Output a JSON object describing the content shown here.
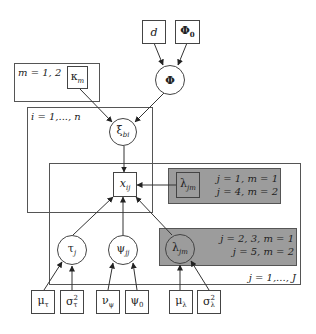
{
  "diagram": {
    "type": "plate-notation-graphical-model",
    "plates": {
      "m": {
        "label": "m = 1, 2"
      },
      "i": {
        "label": "i = 1,..., n"
      },
      "j": {
        "label": "j = 1,..., J"
      }
    },
    "shaded_groups": {
      "upper": {
        "line1": "j = 1, m = 1",
        "line2": "j = 4, m = 2"
      },
      "lower": {
        "line1": "j = 2, 3, m = 1",
        "line2": "j = 5, m = 2"
      }
    },
    "nodes": {
      "d": {
        "base": "d",
        "sub": "",
        "sup": "",
        "shape": "box"
      },
      "phi0": {
        "base": "Φ",
        "sub": "0",
        "sup": "",
        "shape": "box"
      },
      "phi": {
        "base": "Φ",
        "sub": "",
        "sup": "",
        "shape": "circle"
      },
      "kappa": {
        "base": "κ",
        "sub": "m",
        "sup": "",
        "shape": "box"
      },
      "xi": {
        "base": "ξ",
        "sub": "bi",
        "sup": "",
        "shape": "circle"
      },
      "x": {
        "base": "x",
        "sub": "ij",
        "sup": "",
        "shape": "box"
      },
      "lambda_fixed": {
        "base": "λ",
        "sub": "jm",
        "sup": "",
        "shape": "box"
      },
      "tau": {
        "base": "τ",
        "sub": "j",
        "sup": "",
        "shape": "circle"
      },
      "psi": {
        "base": "ψ",
        "sub": "jj",
        "sup": "",
        "shape": "circle"
      },
      "lambda_free": {
        "base": "λ",
        "sub": "jm",
        "sup": "",
        "shape": "circle"
      },
      "mu_tau": {
        "base": "μ",
        "sub": "τ",
        "sup": "",
        "shape": "box"
      },
      "sigma_tau": {
        "base": "σ",
        "sub": "τ",
        "sup": "2",
        "shape": "box"
      },
      "nu_psi": {
        "base": "ν",
        "sub": "ψ",
        "sup": "",
        "shape": "box"
      },
      "psi0": {
        "base": "ψ",
        "sub": "0",
        "sup": "",
        "shape": "box"
      },
      "mu_lambda": {
        "base": "μ",
        "sub": "λ",
        "sup": "",
        "shape": "box"
      },
      "sigma_lambda": {
        "base": "σ",
        "sub": "λ",
        "sup": "2",
        "shape": "box"
      }
    },
    "edges": [
      [
        "d",
        "phi"
      ],
      [
        "phi0",
        "phi"
      ],
      [
        "phi",
        "xi"
      ],
      [
        "kappa",
        "xi"
      ],
      [
        "xi",
        "x"
      ],
      [
        "lambda_fixed",
        "x"
      ],
      [
        "tau",
        "x"
      ],
      [
        "psi",
        "x"
      ],
      [
        "lambda_free",
        "x"
      ],
      [
        "mu_tau",
        "tau"
      ],
      [
        "sigma_tau",
        "tau"
      ],
      [
        "nu_psi",
        "psi"
      ],
      [
        "psi0",
        "psi"
      ],
      [
        "mu_lambda",
        "lambda_free"
      ],
      [
        "sigma_lambda",
        "lambda_free"
      ]
    ],
    "colors": {
      "shade": "#9c9c9c",
      "line": "#444444",
      "background": "#ffffff"
    }
  }
}
